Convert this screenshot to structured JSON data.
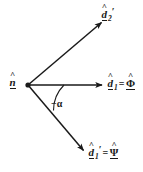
{
  "figure": {
    "type": "vector-diagram",
    "title": "",
    "background_color": "#ffffff",
    "stroke_color": "#1a1a1a",
    "width": 143,
    "height": 172
  },
  "origin": {
    "name": "vertex",
    "x": 28,
    "y": 85,
    "marker": "filled-dot"
  },
  "vectors": [
    {
      "id": "d2-prime",
      "label_base": "d",
      "label_sub": "2",
      "label_prime": "′",
      "accent": "^",
      "underline": true,
      "equals": "",
      "rhs_base": "",
      "rhs_accent": "",
      "tip": {
        "x": 103,
        "y": 21
      },
      "direction_deg": 32.5
    },
    {
      "id": "d1",
      "label_base": "d",
      "label_sub": "1",
      "label_prime": "",
      "accent": "^",
      "underline": true,
      "equals": "=",
      "rhs_base": "Φ",
      "rhs_accent": "^",
      "tip": {
        "x": 104,
        "y": 85
      },
      "direction_deg": 0
    },
    {
      "id": "d1-prime",
      "label_base": "d",
      "label_sub": "1",
      "label_prime": "′",
      "accent": "^",
      "underline": true,
      "equals": "=",
      "rhs_base": "Ψ",
      "rhs_accent": "^",
      "tip": {
        "x": 85,
        "y": 152
      },
      "direction_deg": -45
    }
  ],
  "normal": {
    "id": "n-hat",
    "label_base": "n",
    "accent": "^",
    "underline": true,
    "note": "label at vertex, left side"
  },
  "angle": {
    "id": "minus-alpha",
    "minus": "−",
    "symbol": "α",
    "text": "−α",
    "arc_radius": 36,
    "from_deg": 0,
    "to_deg": -45
  },
  "labels": {
    "d2_prime": "d̂₂′",
    "d1_eq_phi": "d̂₁ = Φ̂",
    "d1_prime_eq_psi": "d̂₁′ = Ψ̂",
    "n_hat": "n̂",
    "angle": "−α"
  }
}
